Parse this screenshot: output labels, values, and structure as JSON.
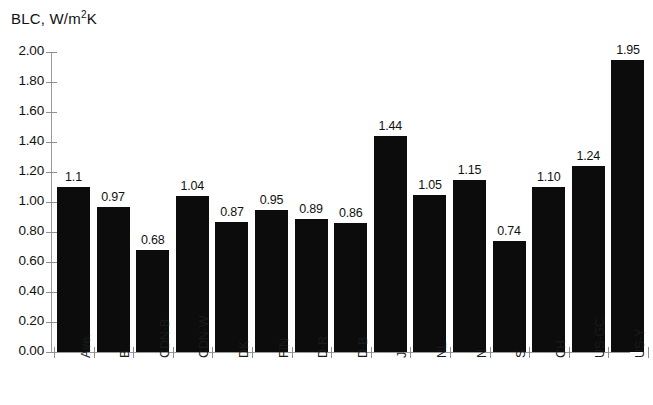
{
  "chart_data": {
    "type": "bar",
    "title_main": "BLC, W/m",
    "title_sup": "2",
    "title_tail": "K",
    "xlabel": "",
    "ylabel": "",
    "ylim": [
      0.0,
      2.0
    ],
    "ytick_step": 0.2,
    "grid": false,
    "legend": "none",
    "bar_color": "#0c0c0c",
    "axis_color": "#9a9a9a",
    "categories": [
      "Ave.",
      "B",
      "CDN-B",
      "CDN-W",
      "DK",
      "FIN",
      "D-R",
      "D-B",
      "J",
      "NL",
      "N",
      "S",
      "CH",
      "US-GC",
      "US-Y"
    ],
    "values": [
      1.1,
      0.97,
      0.68,
      1.04,
      0.87,
      0.95,
      0.89,
      0.86,
      1.44,
      1.05,
      1.15,
      0.74,
      1.1,
      1.24,
      1.95
    ],
    "value_labels": [
      "1.1",
      "0.97",
      "0.68",
      "1.04",
      "0.87",
      "0.95",
      "0.89",
      "0.86",
      "1.44",
      "1.05",
      "1.15",
      "0.74",
      "1.10",
      "1.24",
      "1.95"
    ],
    "ytick_labels": [
      "2.00",
      "1.80",
      "1.60",
      "1.40",
      "1.20",
      "1.00",
      "0.80",
      "0.60",
      "0.40",
      "0.20",
      "0.00"
    ],
    "ytick_values": [
      2.0,
      1.8,
      1.6,
      1.4,
      1.2,
      1.0,
      0.8,
      0.6,
      0.4,
      0.2,
      0.0
    ]
  }
}
